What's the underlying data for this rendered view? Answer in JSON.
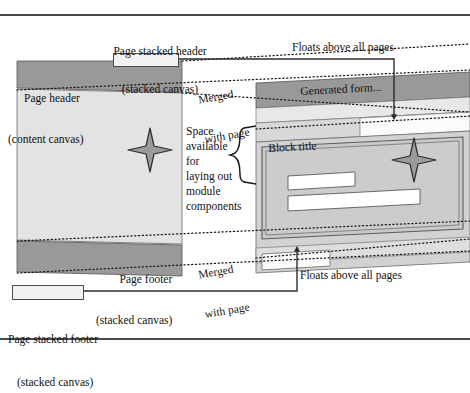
{
  "figure": {
    "kind": "perspective-diagram"
  },
  "labels": {
    "page_stacked_header": "Page stacked header\n(stacked canvas)",
    "page_stacked_header_line1": "Page stacked header",
    "page_stacked_header_line2": "(stacked canvas)",
    "page_header": "Page header\n(content canvas)",
    "page_header_line1": "Page header",
    "page_header_line2": "(content canvas)",
    "page_footer": "Page footer\n(stacked canvas)",
    "page_footer_line1": "Page footer",
    "page_footer_line2": "(stacked canvas)",
    "page_stacked_footer": "Page stacked footer\n (stacked canvas)",
    "page_stacked_footer_line1": "Page stacked footer",
    "page_stacked_footer_line2": "(stacked canvas)",
    "floats_above_top": "Floats above all pages",
    "floats_above_bottom": "Floats above all pages",
    "merged_with_page_top": "Merged\nwith page",
    "merged_with_page_bottom": "Merged\nwith page",
    "space_available": "Space\navailable\nfor\nlaying out\nmodule\ncomponents",
    "generated_form": "Generated form...",
    "block_title": "Block title"
  },
  "icons": {
    "sparkle_left": "four-point-star-icon",
    "sparkle_right": "four-point-star-icon",
    "brace": "curly-brace-icon",
    "arrow_top": "arrow-down-icon",
    "arrow_bottom": "arrow-up-icon"
  },
  "colors": {
    "band_dark": "#999999",
    "canvas_light": "#e3e3e3",
    "canvas_lighter": "#ededed",
    "panel_mid": "#c9c9c9",
    "field_white": "#ffffff",
    "chip_fill": "#f2f2f2",
    "stroke": "#3c3c3c",
    "dotted": "#1a1a1a",
    "page_bg": "#ffffff"
  }
}
